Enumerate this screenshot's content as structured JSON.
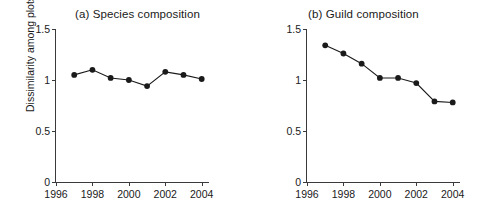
{
  "figure": {
    "ylabel": "Dissimilarity among plots",
    "background": "#ffffff",
    "line_color": "#1a1a1a",
    "axis_color": "#3a3a3a"
  },
  "chart_data": [
    {
      "type": "line",
      "title": "(a) Species composition",
      "xlabel": "",
      "ylabel": "Dissimilarity among plots",
      "x": [
        1997,
        1998,
        1999,
        2000,
        2001,
        2002,
        2003,
        2004
      ],
      "values": [
        1.05,
        1.1,
        1.02,
        1.0,
        0.94,
        1.08,
        1.05,
        1.01
      ],
      "xlim": [
        1996,
        2004.4
      ],
      "ylim": [
        0,
        1.5
      ],
      "xticks": [
        1996,
        1998,
        2000,
        2002,
        2004
      ],
      "xtick_labels": [
        "1996",
        "1998",
        "2000",
        "2002",
        "2004"
      ],
      "yticks": [
        0,
        0.5,
        1,
        1.5
      ],
      "ytick_labels": [
        "0",
        "0.5",
        "1",
        "1.5"
      ],
      "grid": false,
      "legend": "none",
      "marker": "filled-circle",
      "marker_color": "#1a1a1a"
    },
    {
      "type": "line",
      "title": "(b) Guild composition",
      "xlabel": "",
      "ylabel": "",
      "x": [
        1997,
        1998,
        1999,
        2000,
        2001,
        2002,
        2003,
        2004
      ],
      "values": [
        1.34,
        1.26,
        1.16,
        1.02,
        1.02,
        0.97,
        0.79,
        0.78
      ],
      "xlim": [
        1996,
        2004.4
      ],
      "ylim": [
        0,
        1.5
      ],
      "xticks": [
        1996,
        1998,
        2000,
        2002,
        2004
      ],
      "xtick_labels": [
        "1996",
        "1998",
        "2000",
        "2002",
        "2004"
      ],
      "yticks": [
        0,
        0.5,
        1,
        1.5
      ],
      "ytick_labels": [
        "0",
        "0.5",
        "1",
        "1.5"
      ],
      "grid": false,
      "legend": "none",
      "marker": "filled-circle",
      "marker_color": "#1a1a1a"
    }
  ]
}
